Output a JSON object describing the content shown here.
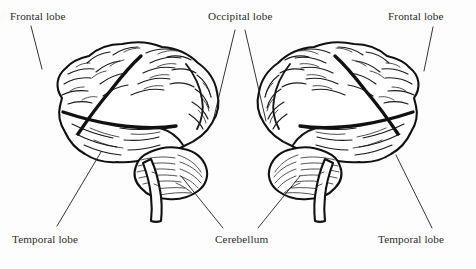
{
  "figure": {
    "background_color": "#fdfdfd",
    "ink_color": "#111111",
    "text_color": "#2b2b2b"
  },
  "labels": {
    "frontal_left": "Frontal lobe",
    "occipital": "Occipital lobe",
    "frontal_right": "Frontal lobe",
    "temporal_left": "Temporal lobe",
    "cerebellum": "Cerebellum",
    "temporal_right": "Temporal lobe"
  },
  "diagrams": [
    {
      "name": "left-brain-lateral-view",
      "orientation": "facing-left",
      "parts": [
        "frontal lobe",
        "parietal lobe",
        "occipital lobe",
        "temporal lobe",
        "cerebellum",
        "brainstem"
      ]
    },
    {
      "name": "right-brain-lateral-view",
      "orientation": "facing-right",
      "parts": [
        "frontal lobe",
        "parietal lobe",
        "occipital lobe",
        "temporal lobe",
        "cerebellum",
        "brainstem"
      ]
    }
  ],
  "leader_lines": [
    {
      "name": "frontal-left",
      "from": [
        31,
        26
      ],
      "to": [
        42,
        69
      ]
    },
    {
      "name": "occipital-left",
      "from": [
        235,
        30
      ],
      "to": [
        213,
        121
      ]
    },
    {
      "name": "occipital-right",
      "from": [
        245,
        30
      ],
      "to": [
        266,
        121
      ]
    },
    {
      "name": "frontal-right",
      "from": [
        433,
        27
      ],
      "to": [
        424,
        71
      ]
    },
    {
      "name": "temporal-left",
      "from": [
        101,
        152
      ],
      "to": [
        57,
        226
      ]
    },
    {
      "name": "cerebellum-left",
      "from": [
        181,
        176
      ],
      "to": [
        223,
        228
      ]
    },
    {
      "name": "cerebellum-right",
      "from": [
        300,
        176
      ],
      "to": [
        258,
        228
      ]
    },
    {
      "name": "temporal-right",
      "from": [
        396,
        155
      ],
      "to": [
        432,
        228
      ]
    }
  ]
}
